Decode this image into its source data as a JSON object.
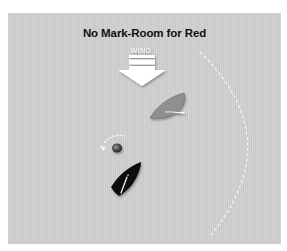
{
  "diagram": {
    "title": "No Mark-Room for Red",
    "wind_label": "WIND",
    "elements": [
      {
        "name": "wind-arrow",
        "label": "WIND",
        "direction": "down"
      },
      {
        "name": "zone-circle",
        "style": "dashed white arc"
      },
      {
        "name": "mark",
        "description": "round mark with white dashed rounding arrow"
      },
      {
        "name": "red-boat",
        "color": "#8f8f8f",
        "description": "gray boat with white boom"
      },
      {
        "name": "black-boat",
        "color": "#111111",
        "description": "black boat with white boom"
      }
    ],
    "colors": {
      "background": "#cfcfcf",
      "outer": "#ffffff",
      "arrow": "#ffffff",
      "red_boat_hull": "#8f8f8f",
      "black_boat_hull": "#111111",
      "mark": "#5a5a5a"
    }
  }
}
